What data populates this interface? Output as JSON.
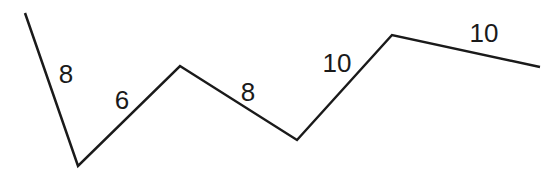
{
  "diagram": {
    "type": "polyline",
    "stroke_color": "#1a1a1a",
    "stroke_width": 2.5,
    "vertices": [
      [
        25,
        13
      ],
      [
        78,
        166
      ],
      [
        180,
        66
      ],
      [
        297,
        140
      ],
      [
        392,
        35
      ],
      [
        540,
        67
      ]
    ],
    "segments": [
      {
        "label": "8",
        "x": 66,
        "y": 83
      },
      {
        "label": "6",
        "x": 122,
        "y": 109
      },
      {
        "label": "8",
        "x": 248,
        "y": 101
      },
      {
        "label": "10",
        "x": 337,
        "y": 72
      },
      {
        "label": "10",
        "x": 484,
        "y": 42
      }
    ]
  }
}
